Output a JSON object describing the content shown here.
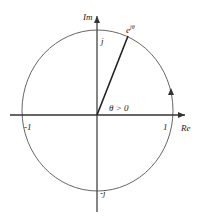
{
  "diagram": {
    "axes": {
      "real_label": "Re",
      "imag_label": "Im"
    },
    "ticks": {
      "pos_one": "1",
      "neg_one": "-1",
      "pos_j": "j",
      "neg_j": "-j"
    },
    "point_label": "e",
    "point_exponent": "jθ",
    "angle_label": "θ > 0",
    "colors": {
      "stroke": "#333333",
      "background": "#ffffff"
    }
  }
}
